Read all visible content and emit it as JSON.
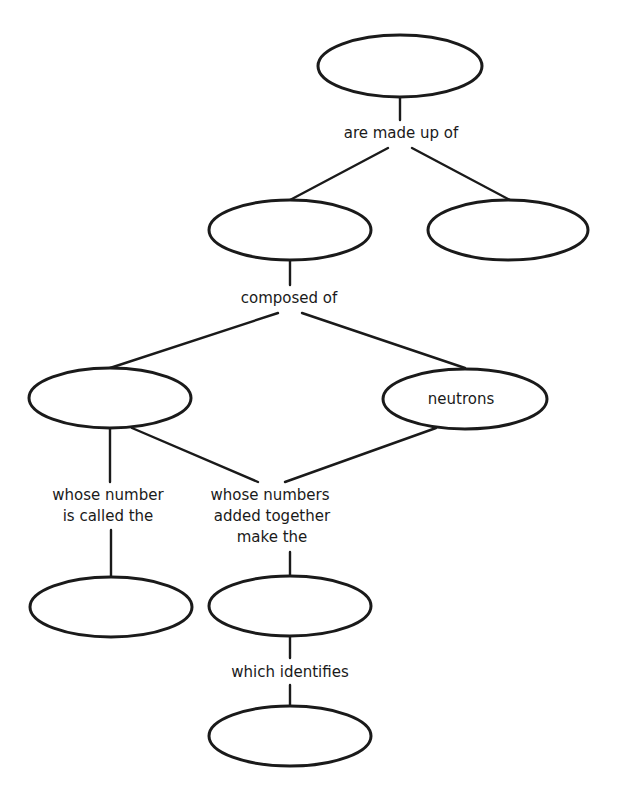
{
  "diagram": {
    "title": "",
    "nodes": [
      {
        "id": "top",
        "label": ""
      },
      {
        "id": "mid-left",
        "label": ""
      },
      {
        "id": "mid-right",
        "label": ""
      },
      {
        "id": "left",
        "label": ""
      },
      {
        "id": "neutrons",
        "label": "neutrons"
      },
      {
        "id": "bottom-left",
        "label": ""
      },
      {
        "id": "bottom-center",
        "label": ""
      },
      {
        "id": "last",
        "label": ""
      }
    ],
    "links": [
      {
        "id": "are-made-up-of",
        "lines": [
          "are made up of"
        ]
      },
      {
        "id": "composed-of",
        "lines": [
          "composed of"
        ]
      },
      {
        "id": "whose-number",
        "lines": [
          "whose number",
          "is called the"
        ]
      },
      {
        "id": "whose-numbers",
        "lines": [
          "whose numbers",
          "added together",
          "make the"
        ]
      },
      {
        "id": "which-identifies",
        "lines": [
          "which identifies"
        ]
      }
    ]
  }
}
